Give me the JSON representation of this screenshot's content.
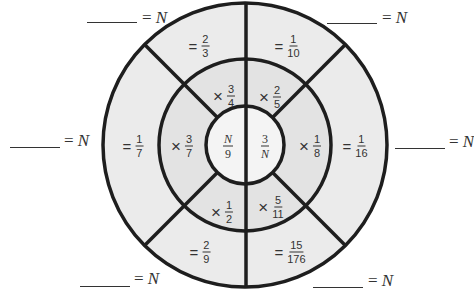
{
  "diagram": {
    "type": "concentric-fraction-wheel",
    "colors": {
      "outer_ring_fill": "#ebebeb",
      "middle_ring_fill": "#e3e3e3",
      "inner_circle_fill": "#f4f4f4",
      "stroke": "#1e1e1e"
    },
    "inner_circle": {
      "left": {
        "numerator": "N",
        "denominator": "9"
      },
      "right": {
        "numerator": "3",
        "denominator": "N"
      }
    },
    "middle_ring": [
      {
        "position": "top-left",
        "operator": "×",
        "numerator": "3",
        "denominator": "4"
      },
      {
        "position": "top-right",
        "operator": "×",
        "numerator": "2",
        "denominator": "5"
      },
      {
        "position": "right",
        "operator": "×",
        "numerator": "1",
        "denominator": "8"
      },
      {
        "position": "bottom-right",
        "operator": "×",
        "numerator": "5",
        "denominator": "11"
      },
      {
        "position": "bottom-left",
        "operator": "×",
        "numerator": "1",
        "denominator": "2"
      },
      {
        "position": "left",
        "operator": "×",
        "numerator": "3",
        "denominator": "7"
      }
    ],
    "outer_ring": [
      {
        "position": "top-left",
        "operator": "=",
        "numerator": "2",
        "denominator": "3"
      },
      {
        "position": "top-right",
        "operator": "=",
        "numerator": "1",
        "denominator": "10"
      },
      {
        "position": "right",
        "operator": "=",
        "numerator": "1",
        "denominator": "16"
      },
      {
        "position": "bottom-right",
        "operator": "=",
        "numerator": "15",
        "denominator": "176"
      },
      {
        "position": "bottom-left",
        "operator": "=",
        "numerator": "2",
        "denominator": "9"
      },
      {
        "position": "left",
        "operator": "=",
        "numerator": "1",
        "denominator": "7"
      }
    ],
    "answer_blanks": [
      {
        "position": "top-left",
        "equals": "=",
        "variable": "N"
      },
      {
        "position": "top-right",
        "equals": "=",
        "variable": "N"
      },
      {
        "position": "right",
        "equals": "=",
        "variable": "N"
      },
      {
        "position": "bottom-right",
        "equals": "=",
        "variable": "N"
      },
      {
        "position": "bottom-left",
        "equals": "=",
        "variable": "N"
      },
      {
        "position": "left",
        "equals": "=",
        "variable": "N"
      }
    ]
  }
}
